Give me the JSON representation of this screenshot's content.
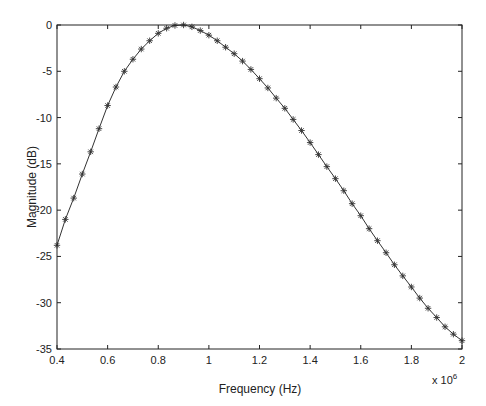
{
  "chart_data": {
    "type": "line",
    "title": "",
    "xlabel": "Frequency (Hz)",
    "ylabel": "Magnitude (dB)",
    "x_multiplier_label": "x 10",
    "x_multiplier_exponent": "6",
    "xlim": [
      0.4,
      2.0
    ],
    "ylim": [
      -35,
      0
    ],
    "x_ticks": [
      0.4,
      0.6,
      0.8,
      1.0,
      1.2,
      1.4,
      1.6,
      1.8,
      2.0
    ],
    "x_tick_labels": [
      "0.4",
      "0.6",
      "0.8",
      "1",
      "1.2",
      "1.4",
      "1.6",
      "1.8",
      "2"
    ],
    "y_ticks": [
      0,
      -5,
      -10,
      -15,
      -20,
      -25,
      -30,
      -35
    ],
    "y_tick_labels": [
      "0",
      "-5",
      "-10",
      "-15",
      "-20",
      "-25",
      "-30",
      "-35"
    ],
    "grid": false,
    "legend": null,
    "series": [
      {
        "name": "magnitude response",
        "marker": "asterisk",
        "color": "#333333",
        "x": [
          0.4,
          0.433,
          0.466,
          0.5,
          0.533,
          0.566,
          0.6,
          0.633,
          0.666,
          0.7,
          0.733,
          0.766,
          0.8,
          0.833,
          0.866,
          0.9,
          0.933,
          0.966,
          1.0,
          1.033,
          1.066,
          1.1,
          1.133,
          1.166,
          1.2,
          1.233,
          1.266,
          1.3,
          1.333,
          1.366,
          1.4,
          1.433,
          1.466,
          1.5,
          1.533,
          1.566,
          1.6,
          1.633,
          1.666,
          1.7,
          1.733,
          1.766,
          1.8,
          1.833,
          1.866,
          1.9,
          1.933,
          1.966,
          2.0
        ],
        "values": [
          -23.8,
          -21.0,
          -18.7,
          -16.1,
          -13.7,
          -11.2,
          -8.7,
          -6.7,
          -5.0,
          -3.7,
          -2.6,
          -1.7,
          -0.9,
          -0.35,
          -0.05,
          0.0,
          -0.2,
          -0.6,
          -1.1,
          -1.7,
          -2.4,
          -3.1,
          -3.9,
          -4.8,
          -5.8,
          -6.8,
          -7.9,
          -9.0,
          -10.2,
          -11.4,
          -12.7,
          -14.0,
          -15.3,
          -16.6,
          -17.9,
          -19.3,
          -20.6,
          -22.0,
          -23.3,
          -24.6,
          -25.9,
          -27.1,
          -28.3,
          -29.5,
          -30.6,
          -31.6,
          -32.6,
          -33.4,
          -34.1
        ]
      }
    ]
  }
}
